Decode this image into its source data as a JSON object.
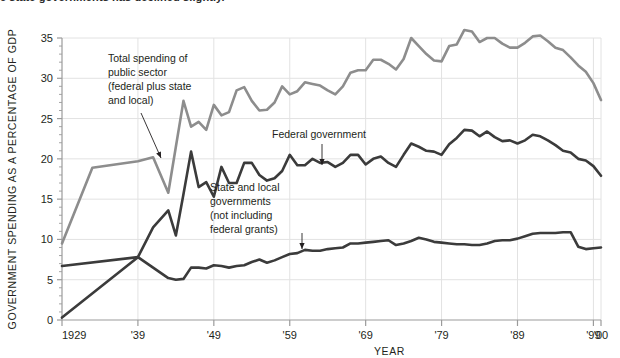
{
  "caption": {
    "text": "e state governments has declined slightly."
  },
  "chart_data": {
    "type": "line",
    "title": "",
    "xlabel": "YEAR",
    "ylabel": "GOVERNMENT SPENDING AS A PERCENTAGE OF GDP",
    "xlim": [
      1929,
      2000
    ],
    "ylim": [
      0,
      35
    ],
    "grid": true,
    "legend_position": "inline-annotations",
    "xticks": [
      1929,
      1939,
      1949,
      1959,
      1969,
      1979,
      1989,
      1999,
      2000
    ],
    "xtick_labels": [
      "1929",
      "'39",
      "'49",
      "'59",
      "'69",
      "'79",
      "'89",
      "'99",
      "'00"
    ],
    "yticks": [
      0,
      5,
      10,
      15,
      20,
      25,
      30,
      35
    ],
    "ytick_labels": [
      "0",
      "5",
      "10",
      "15",
      "20",
      "25",
      "30",
      "35"
    ],
    "y_minor_step": 1,
    "colors": {
      "total": "#8d8d8d",
      "federal": "#3b3b3b",
      "state_local": "#3b3b3b",
      "grid": "#e2e2e2",
      "axis": "#9b9b9b"
    },
    "series": [
      {
        "name": "Total spending of public sector (federal plus state and local)",
        "key": "total",
        "color": "#8d8d8d",
        "x": [
          1929,
          1933,
          1939,
          1941,
          1943,
          1944,
          1945,
          1946,
          1947,
          1948,
          1949,
          1950,
          1951,
          1952,
          1953,
          1954,
          1955,
          1956,
          1957,
          1958,
          1959,
          1960,
          1961,
          1962,
          1963,
          1964,
          1965,
          1966,
          1967,
          1968,
          1969,
          1970,
          1971,
          1972,
          1973,
          1974,
          1975,
          1976,
          1977,
          1978,
          1979,
          1980,
          1981,
          1982,
          1983,
          1984,
          1985,
          1986,
          1987,
          1988,
          1989,
          1990,
          1991,
          1992,
          1993,
          1994,
          1995,
          1996,
          1997,
          1998,
          1999,
          2000
        ],
        "values": [
          9.5,
          18.9,
          19.7,
          20.2,
          15.8,
          21.5,
          27.2,
          24.0,
          24.6,
          23.6,
          26.7,
          25.4,
          25.8,
          28.5,
          28.9,
          27.2,
          26.0,
          26.1,
          27.0,
          29.0,
          28.0,
          28.4,
          29.5,
          29.3,
          29.1,
          28.5,
          28.0,
          29.0,
          30.7,
          31.0,
          31.0,
          32.3,
          32.3,
          31.8,
          31.1,
          32.4,
          35.0,
          34.0,
          33.0,
          32.2,
          32.1,
          34.0,
          34.2,
          36.0,
          35.8,
          34.5,
          35.0,
          35.0,
          34.3,
          33.8,
          33.8,
          34.4,
          35.2,
          35.3,
          34.6,
          33.8,
          33.5,
          32.6,
          31.6,
          30.8,
          29.4,
          27.3
        ]
      },
      {
        "name": "Federal government",
        "key": "federal",
        "color": "#3b3b3b",
        "x": [
          1929,
          1939,
          1941,
          1943,
          1944,
          1945,
          1946,
          1947,
          1948,
          1949,
          1950,
          1951,
          1952,
          1953,
          1954,
          1955,
          1956,
          1957,
          1958,
          1959,
          1960,
          1961,
          1962,
          1963,
          1964,
          1965,
          1966,
          1967,
          1968,
          1969,
          1970,
          1971,
          1972,
          1973,
          1974,
          1975,
          1976,
          1977,
          1978,
          1979,
          1980,
          1981,
          1982,
          1983,
          1984,
          1985,
          1986,
          1987,
          1988,
          1989,
          1990,
          1991,
          1992,
          1993,
          1994,
          1995,
          1996,
          1997,
          1998,
          1999,
          2000
        ],
        "values": [
          0.3,
          7.8,
          11.5,
          13.6,
          10.5,
          15.6,
          20.9,
          16.5,
          17.1,
          15.3,
          19.0,
          17.0,
          17.0,
          19.5,
          19.5,
          18.0,
          17.3,
          17.6,
          18.5,
          20.5,
          19.2,
          19.2,
          20.0,
          19.5,
          19.6,
          19.0,
          19.5,
          20.5,
          20.5,
          19.3,
          20.0,
          20.3,
          19.5,
          19.0,
          20.5,
          21.9,
          21.5,
          21.0,
          20.9,
          20.5,
          21.8,
          22.6,
          23.6,
          23.5,
          22.8,
          23.4,
          22.7,
          22.2,
          22.3,
          21.9,
          22.3,
          23.0,
          22.8,
          22.3,
          21.7,
          21.0,
          20.8,
          20.0,
          19.8,
          19.1,
          17.9
        ]
      },
      {
        "name": "State and local governments (not including federal grants)",
        "key": "state_local",
        "color": "#3b3b3b",
        "x": [
          1929,
          1939,
          1941,
          1943,
          1944,
          1945,
          1946,
          1947,
          1948,
          1949,
          1950,
          1951,
          1952,
          1953,
          1954,
          1955,
          1956,
          1957,
          1958,
          1959,
          1960,
          1961,
          1962,
          1963,
          1964,
          1965,
          1966,
          1967,
          1968,
          1969,
          1970,
          1971,
          1972,
          1973,
          1974,
          1975,
          1976,
          1977,
          1978,
          1979,
          1980,
          1981,
          1982,
          1983,
          1984,
          1985,
          1986,
          1987,
          1988,
          1989,
          1990,
          1991,
          1992,
          1993,
          1994,
          1995,
          1996,
          1997,
          1998,
          1999,
          2000
        ],
        "values": [
          6.7,
          7.8,
          6.5,
          5.2,
          5.0,
          5.1,
          6.5,
          6.5,
          6.4,
          6.8,
          6.7,
          6.5,
          6.7,
          6.8,
          7.2,
          7.5,
          7.1,
          7.4,
          7.8,
          8.2,
          8.3,
          8.7,
          8.6,
          8.6,
          8.8,
          8.9,
          9.0,
          9.5,
          9.5,
          9.6,
          9.7,
          9.8,
          9.9,
          9.3,
          9.5,
          9.8,
          10.2,
          10.0,
          9.7,
          9.6,
          9.5,
          9.4,
          9.4,
          9.3,
          9.3,
          9.5,
          9.8,
          9.9,
          9.9,
          10.1,
          10.4,
          10.7,
          10.8,
          10.8,
          10.8,
          10.9,
          10.9,
          9.1,
          8.8,
          8.9,
          9.0
        ]
      }
    ],
    "annotations": [
      {
        "id": "total-annotation",
        "lines": [
          "Total spending of",
          "public sector",
          "(federal plus state",
          "and local)"
        ],
        "text_x": 108,
        "text_y": 62,
        "arrow": {
          "x1": 141,
          "y1": 113,
          "x2": 161,
          "y2": 158
        }
      },
      {
        "id": "federal-annotation",
        "lines": [
          "Federal government"
        ],
        "text_x": 272,
        "text_y": 138,
        "arrow": {
          "x1": 322,
          "y1": 144,
          "x2": 322,
          "y2": 165
        }
      },
      {
        "id": "state-local-annotation",
        "lines": [
          "State and local",
          "governments",
          "(not including",
          "federal grants)"
        ],
        "text_x": 210,
        "text_y": 191,
        "arrow": {
          "x1": 302,
          "y1": 233,
          "x2": 302,
          "y2": 249
        }
      }
    ]
  }
}
